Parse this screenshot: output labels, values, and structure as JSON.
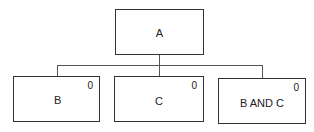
{
  "diagram": {
    "type": "tree",
    "root": {
      "id": "A",
      "label": "A"
    },
    "children": [
      {
        "id": "B",
        "label": "B",
        "corner_value": "0"
      },
      {
        "id": "C",
        "label": "C",
        "corner_value": "0"
      },
      {
        "id": "BC",
        "label": "B AND C",
        "corner_value": "0"
      }
    ],
    "edges": [
      {
        "from": "A",
        "to": "B"
      },
      {
        "from": "A",
        "to": "C"
      },
      {
        "from": "A",
        "to": "BC"
      }
    ]
  }
}
